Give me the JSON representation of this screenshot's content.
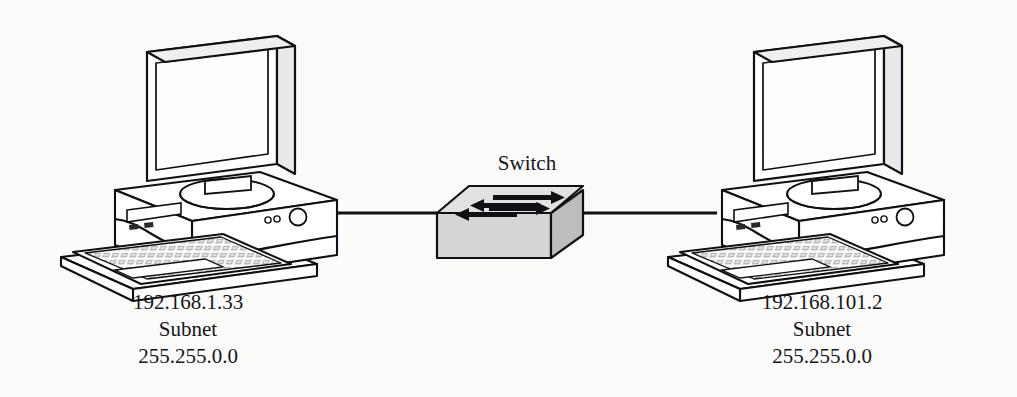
{
  "diagram": {
    "background_color": "#fbfbfa",
    "line_color": "#101014",
    "text_color": "#16161a"
  },
  "nodes": {
    "left_host": {
      "icon": "desktop-computer-icon",
      "ip_address": "192.168.1.33",
      "subnet_label": "Subnet",
      "subnet_mask": "255.255.0.0"
    },
    "switch": {
      "icon": "network-switch-icon",
      "label": "Switch",
      "top_face_color": "#e2e2e2",
      "front_face_color": "#d6d6d6",
      "side_face_color": "#bdbdbd",
      "arrow_color": "#101014",
      "arrow_count": 4
    },
    "right_host": {
      "icon": "desktop-computer-icon",
      "ip_address": "192.168.101.2",
      "subnet_label": "Subnet",
      "subnet_mask": "255.255.0.0"
    }
  },
  "links": [
    {
      "name": "left-host-to-switch",
      "from": "left_host",
      "to": "switch"
    },
    {
      "name": "switch-to-right-host",
      "from": "switch",
      "to": "right_host"
    }
  ]
}
